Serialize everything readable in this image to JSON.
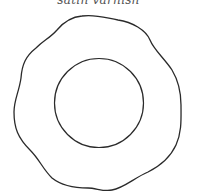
{
  "caption": "satin varnish",
  "figure": {
    "outer_shape": "wavy-plate-rim",
    "inner_shape": "circle",
    "stroke_color": "#2a2a2a"
  }
}
